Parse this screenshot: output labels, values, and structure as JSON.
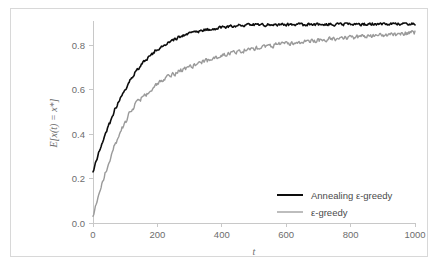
{
  "figure": {
    "background_color": "#ffffff",
    "border_color": "#d8d8d8",
    "axis_color": "#c8c8c8",
    "tick_label_color": "#6d6d6d"
  },
  "chart_data": {
    "type": "line",
    "title": "",
    "subtitle": "",
    "xlabel": "t",
    "ylabel": "E[x(t) = x*]",
    "xlim": [
      0,
      1000
    ],
    "ylim": [
      0.0,
      0.9
    ],
    "xticks": [
      0,
      200,
      400,
      600,
      800,
      1000
    ],
    "xtick_labels": [
      "0",
      "200",
      "400",
      "600",
      "800",
      "1000"
    ],
    "yticks": [
      0.0,
      0.2,
      0.4,
      0.6,
      0.8
    ],
    "ytick_labels": [
      "0.0",
      "0.2",
      "0.4",
      "0.6",
      "0.8"
    ],
    "grid": false,
    "legend_position": "lower right",
    "series": [
      {
        "name": "Annealing ε-greedy",
        "color": "#0d0d0d",
        "linewidth": 1.6,
        "noise": 0.006,
        "x": [
          0,
          10,
          20,
          30,
          40,
          50,
          60,
          70,
          80,
          90,
          100,
          120,
          140,
          160,
          180,
          200,
          225,
          250,
          275,
          300,
          325,
          350,
          375,
          400,
          450,
          500,
          550,
          600,
          650,
          700,
          750,
          800,
          850,
          900,
          950,
          1000
        ],
        "values": [
          0.23,
          0.28,
          0.325,
          0.365,
          0.405,
          0.445,
          0.48,
          0.515,
          0.545,
          0.575,
          0.605,
          0.655,
          0.695,
          0.73,
          0.758,
          0.782,
          0.807,
          0.826,
          0.841,
          0.853,
          0.862,
          0.87,
          0.876,
          0.881,
          0.888,
          0.891,
          0.892,
          0.893,
          0.893,
          0.894,
          0.894,
          0.895,
          0.895,
          0.896,
          0.896,
          0.897
        ]
      },
      {
        "name": "ε-greedy",
        "color": "#9a9a9a",
        "linewidth": 1.4,
        "noise": 0.009,
        "x": [
          0,
          10,
          20,
          30,
          40,
          50,
          60,
          70,
          80,
          90,
          100,
          120,
          140,
          160,
          180,
          200,
          225,
          250,
          275,
          300,
          325,
          350,
          375,
          400,
          450,
          500,
          550,
          600,
          650,
          700,
          750,
          800,
          850,
          900,
          950,
          1000
        ],
        "values": [
          0.03,
          0.085,
          0.135,
          0.185,
          0.232,
          0.276,
          0.318,
          0.357,
          0.394,
          0.428,
          0.46,
          0.513,
          0.548,
          0.571,
          0.598,
          0.625,
          0.652,
          0.672,
          0.688,
          0.703,
          0.717,
          0.73,
          0.742,
          0.753,
          0.772,
          0.787,
          0.798,
          0.807,
          0.815,
          0.822,
          0.828,
          0.834,
          0.839,
          0.845,
          0.851,
          0.858
        ]
      }
    ]
  },
  "legend": {
    "entries": [
      {
        "label": "Annealing ε-greedy",
        "color": "#0d0d0d"
      },
      {
        "label": "ε-greedy",
        "color": "#9a9a9a"
      }
    ]
  }
}
